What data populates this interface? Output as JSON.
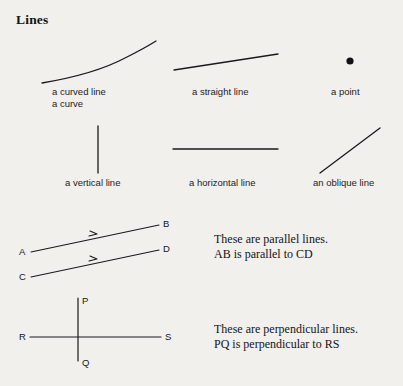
{
  "page": {
    "title": "Lines",
    "background_color": "#f1f0ed",
    "ink_color": "#1a1a1a"
  },
  "figures": [
    {
      "id": "curved-line",
      "icon": "curved-line-icon",
      "caption_line1": "a curved line",
      "caption_line2": "a curve"
    },
    {
      "id": "straight-line",
      "icon": "straight-line-icon",
      "caption_line1": "a straight line",
      "caption_line2": ""
    },
    {
      "id": "point",
      "icon": "point-dot-icon",
      "caption_line1": "a point",
      "caption_line2": ""
    },
    {
      "id": "vertical-line",
      "icon": "vertical-line-icon",
      "caption_line1": "a vertical line",
      "caption_line2": ""
    },
    {
      "id": "horizontal-line",
      "icon": "horizontal-line-icon",
      "caption_line1": "a horizontal line",
      "caption_line2": ""
    },
    {
      "id": "oblique-line",
      "icon": "oblique-line-icon",
      "caption_line1": "an oblique line",
      "caption_line2": ""
    }
  ],
  "parallel": {
    "labels": {
      "a": "A",
      "b": "B",
      "c": "C",
      "d": "D"
    },
    "note_line1": "These are parallel lines.",
    "note_line2": "AB is parallel to CD"
  },
  "perpendicular": {
    "labels": {
      "p": "P",
      "q": "Q",
      "r": "R",
      "s": "S"
    },
    "note_line1": "These are perpendicular lines.",
    "note_line2": "PQ is perpendicular to RS"
  }
}
